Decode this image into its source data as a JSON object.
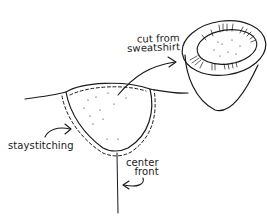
{
  "diagram": {
    "type": "sewing-illustration",
    "labels": {
      "cut_line1": "cut from",
      "cut_line2": "sweatshirt",
      "staystitching": "staystitching",
      "center_line1": "center",
      "center_line2": "front"
    },
    "parts": [
      {
        "id": "neckline-cutout",
        "description": "scooped cutout with dashed staystitching"
      },
      {
        "id": "cut-piece",
        "description": "cone-shaped piece cut from sweatshirt with ribbed rim"
      },
      {
        "id": "center-front-line",
        "description": "vertical line marking center front"
      }
    ],
    "colors": {
      "stroke": "#1a1a1a",
      "background": "#ffffff"
    }
  }
}
